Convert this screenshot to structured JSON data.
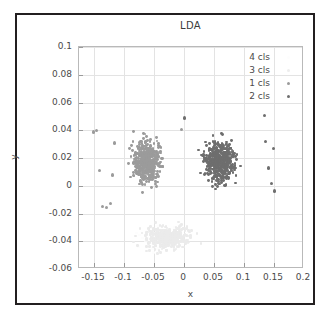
{
  "figure": {
    "title": "LDA",
    "background": "#ffffff",
    "frame_color": "#231f20"
  },
  "chart_data": {
    "type": "scatter",
    "title": "LDA",
    "xlabel": "x",
    "ylabel": "y",
    "xlim": [
      -0.175,
      0.2
    ],
    "ylim": [
      -0.06,
      0.1
    ],
    "xticks": [
      -0.15,
      -0.1,
      -0.05,
      0,
      0.05,
      0.1,
      0.15,
      0.2
    ],
    "xticklabels": [
      "-0.15",
      "-0.1",
      "-0.05",
      "0",
      "0.05",
      "0.1",
      "0.15",
      "0.2"
    ],
    "yticks": [
      -0.06,
      -0.04,
      -0.02,
      0,
      0.02,
      0.04,
      0.06,
      0.08,
      0.1
    ],
    "yticklabels": [
      "-0.06",
      "-0.04",
      "-0.02",
      "0",
      "0.02",
      "0.04",
      "0.06",
      "0.08",
      "0.1"
    ],
    "grid": true,
    "grid_color": "#e3e3e3",
    "legend_position": "upper right",
    "legend": [
      {
        "label": "4 cls",
        "color": "#fdfdfd",
        "size": 3.4
      },
      {
        "label": "3 cls",
        "color": "#ededed",
        "size": 3.4
      },
      {
        "label": "1 cls",
        "color": "#9b9b9b",
        "size": 3.4
      },
      {
        "label": "2 cls",
        "color": "#6e6e6e",
        "size": 3.4
      }
    ],
    "series": [
      {
        "name": "4 cls",
        "color": "#fdfdfd",
        "marker_size": 2.6,
        "n_points": 120,
        "cluster": {
          "x_range": [
            -0.105,
            0.02
          ],
          "y_range": [
            -0.055,
            -0.021
          ]
        },
        "points": []
      },
      {
        "name": "3 cls",
        "color": "#ebebeb",
        "marker_size": 2.6,
        "n_points": 430,
        "cluster": {
          "x_range": [
            -0.11,
            0.055
          ],
          "y_range": [
            -0.056,
            -0.019
          ]
        },
        "points": []
      },
      {
        "name": "1 cls",
        "color": "#9b9b9b",
        "marker_size": 2.8,
        "n_points": 480,
        "cluster": {
          "x_range": [
            -0.112,
            -0.012
          ],
          "y_range": [
            -0.017,
            0.052
          ]
        },
        "points": []
      },
      {
        "name": "2 cls",
        "color": "#6e6e6e",
        "marker_size": 2.8,
        "n_points": 470,
        "cluster": {
          "x_range": [
            0.005,
            0.115
          ],
          "y_range": [
            -0.017,
            0.052
          ]
        },
        "points": []
      }
    ],
    "outliers": [
      {
        "x": -0.1505,
        "y": 0.0388,
        "series": "1 cls"
      },
      {
        "x": -0.1455,
        "y": 0.0398,
        "series": "1 cls"
      },
      {
        "x": -0.1415,
        "y": 0.0108,
        "series": "1 cls"
      },
      {
        "x": -0.1365,
        "y": -0.0148,
        "series": "1 cls"
      },
      {
        "x": -0.1285,
        "y": -0.0158,
        "series": "1 cls"
      },
      {
        "x": -0.1225,
        "y": -0.0128,
        "series": "1 cls"
      },
      {
        "x": -0.1185,
        "y": 0.0078,
        "series": "1 cls"
      },
      {
        "x": -0.1165,
        "y": 0.0308,
        "series": "1 cls"
      },
      {
        "x": 0.1335,
        "y": 0.0508,
        "series": "2 cls"
      },
      {
        "x": 0.1365,
        "y": 0.0318,
        "series": "2 cls"
      },
      {
        "x": 0.1405,
        "y": 0.0128,
        "series": "2 cls"
      },
      {
        "x": 0.1455,
        "y": 0.0018,
        "series": "2 cls"
      },
      {
        "x": 0.1495,
        "y": 0.0268,
        "series": "2 cls"
      },
      {
        "x": 0.1505,
        "y": -0.0038,
        "series": "2 cls"
      },
      {
        "x": 0.0005,
        "y": 0.0488,
        "series": "2 cls"
      },
      {
        "x": -0.0035,
        "y": 0.0408,
        "series": "1 cls"
      }
    ]
  }
}
